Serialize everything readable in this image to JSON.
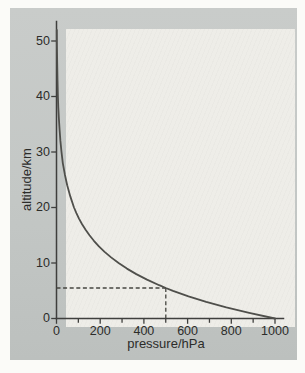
{
  "chart_data": {
    "type": "line",
    "title": "",
    "xlabel": "pressure/hPa",
    "ylabel": "altitude/km",
    "xlim": [
      0,
      1000
    ],
    "ylim": [
      0,
      53.5
    ],
    "grid": false,
    "legend": "none",
    "x_major_ticks": [
      0,
      200,
      400,
      600,
      800,
      1000
    ],
    "x_minor_ticks": [
      100,
      300,
      500,
      700,
      900
    ],
    "y_major_ticks": [
      0,
      10,
      20,
      30,
      40,
      50
    ],
    "series": [
      {
        "name": "atmospheric-pressure-vs-altitude",
        "color": "#4f4f4b",
        "points_format": [
          "pressure_hPa",
          "altitude_km"
        ],
        "points": [
          [
            1000,
            0
          ],
          [
            882,
            1
          ],
          [
            777,
            2
          ],
          [
            685,
            3
          ],
          [
            604,
            4
          ],
          [
            533,
            5
          ],
          [
            500,
            5.5
          ],
          [
            470,
            6
          ],
          [
            414,
            7
          ],
          [
            365,
            8
          ],
          [
            322,
            9
          ],
          [
            284,
            10
          ],
          [
            250,
            11
          ],
          [
            220,
            12
          ],
          [
            194,
            13
          ],
          [
            171,
            14
          ],
          [
            151,
            15
          ],
          [
            133,
            16
          ],
          [
            117,
            17
          ],
          [
            103,
            18
          ],
          [
            91,
            19
          ],
          [
            80,
            20
          ],
          [
            63,
            22
          ],
          [
            49,
            24
          ],
          [
            38,
            26
          ],
          [
            29,
            28
          ],
          [
            23,
            30
          ],
          [
            18,
            32
          ],
          [
            14,
            34
          ],
          [
            11,
            36
          ],
          [
            8.3,
            38
          ],
          [
            6.5,
            40
          ],
          [
            4.4,
            43
          ],
          [
            3,
            46
          ],
          [
            2,
            49
          ],
          [
            1.4,
            52
          ]
        ]
      }
    ],
    "guides": {
      "style": "dashed",
      "pressure_hPa": 500,
      "altitude_km": 5.5
    }
  },
  "colors": {
    "page_background": "#fbfbf8",
    "panel_background": "#c3c7c5",
    "plot_area_background": "#eeede8",
    "axis": "#3f3f3d",
    "curve": "#4f4f4b",
    "guide_dashes": "#454540",
    "text": "#2c2c2a"
  }
}
